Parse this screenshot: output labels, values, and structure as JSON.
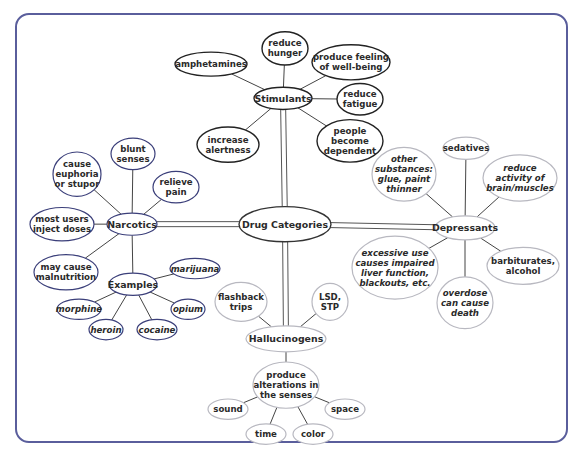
{
  "diagram": {
    "title": "Drug Categories",
    "colors": {
      "frame": "#5a5e9c",
      "stimulants": "#222222",
      "narcotics": "#3b3f7a",
      "depressants": "#b8b8c0",
      "hallucinogens": "#b8b8c0",
      "center": "#333333"
    },
    "nodes": [
      {
        "id": "center",
        "text": [
          "Drug Categories"
        ],
        "cx": 285,
        "cy": 238,
        "rx": 46,
        "ry": 19,
        "group": "center",
        "big": true
      },
      {
        "id": "stimulants",
        "text": [
          "Stimulants"
        ],
        "cx": 283,
        "cy": 102,
        "rx": 29,
        "ry": 12,
        "group": "stimulants",
        "big": true
      },
      {
        "id": "amphetamines",
        "text": [
          "amphetamines"
        ],
        "cx": 211,
        "cy": 65,
        "rx": 36,
        "ry": 13,
        "group": "stimulants"
      },
      {
        "id": "reduce-hunger",
        "text": [
          "reduce",
          "hunger"
        ],
        "cx": 285,
        "cy": 48,
        "rx": 23,
        "ry": 18,
        "group": "stimulants"
      },
      {
        "id": "well-being",
        "text": [
          "produce feeling",
          "of well-being"
        ],
        "cx": 351,
        "cy": 63,
        "rx": 39,
        "ry": 19,
        "group": "stimulants"
      },
      {
        "id": "reduce-fatigue",
        "text": [
          "reduce",
          "fatigue"
        ],
        "cx": 360,
        "cy": 103,
        "rx": 23,
        "ry": 17,
        "group": "stimulants"
      },
      {
        "id": "increase-alertness",
        "text": [
          "increase",
          "alertness"
        ],
        "cx": 228,
        "cy": 152,
        "rx": 31,
        "ry": 19,
        "group": "stimulants"
      },
      {
        "id": "dependent",
        "text": [
          "people",
          "become",
          "dependent"
        ],
        "cx": 350,
        "cy": 148,
        "rx": 33,
        "ry": 23,
        "group": "stimulants"
      },
      {
        "id": "narcotics",
        "text": [
          "Narcotics"
        ],
        "cx": 132,
        "cy": 238,
        "rx": 25,
        "ry": 12,
        "group": "narcotics",
        "big": true
      },
      {
        "id": "blunt-senses",
        "text": [
          "blunt",
          "senses"
        ],
        "cx": 133,
        "cy": 162,
        "rx": 22,
        "ry": 17,
        "group": "narcotics"
      },
      {
        "id": "euphoria",
        "text": [
          "cause",
          "euphoria",
          "or stupor"
        ],
        "cx": 77,
        "cy": 184,
        "rx": 24,
        "ry": 24,
        "group": "narcotics"
      },
      {
        "id": "relieve-pain",
        "text": [
          "relieve",
          "pain"
        ],
        "cx": 176,
        "cy": 198,
        "rx": 23,
        "ry": 17,
        "group": "narcotics"
      },
      {
        "id": "inject-doses",
        "text": [
          "most users",
          "inject doses"
        ],
        "cx": 62,
        "cy": 238,
        "rx": 32,
        "ry": 18,
        "group": "narcotics"
      },
      {
        "id": "malnutrition",
        "text": [
          "may cause",
          "malnutrition"
        ],
        "cx": 66,
        "cy": 290,
        "rx": 32,
        "ry": 19,
        "group": "narcotics"
      },
      {
        "id": "examples",
        "text": [
          "Examples"
        ],
        "cx": 133,
        "cy": 303,
        "rx": 24,
        "ry": 12,
        "group": "narcotics",
        "big": true
      },
      {
        "id": "marijuana",
        "text": [
          "marijuana"
        ],
        "cx": 195,
        "cy": 286,
        "rx": 25,
        "ry": 11,
        "group": "narcotics",
        "it": true
      },
      {
        "id": "morphine",
        "text": [
          "morphine"
        ],
        "cx": 79,
        "cy": 330,
        "rx": 22,
        "ry": 11,
        "group": "narcotics",
        "it": true
      },
      {
        "id": "opium",
        "text": [
          "opium"
        ],
        "cx": 188,
        "cy": 330,
        "rx": 17,
        "ry": 11,
        "group": "narcotics",
        "it": true
      },
      {
        "id": "heroin",
        "text": [
          "heroin"
        ],
        "cx": 106,
        "cy": 352,
        "rx": 17,
        "ry": 11,
        "group": "narcotics",
        "it": true
      },
      {
        "id": "cocaine",
        "text": [
          "cocaine"
        ],
        "cx": 157,
        "cy": 352,
        "rx": 20,
        "ry": 11,
        "group": "narcotics",
        "it": true
      },
      {
        "id": "depressants",
        "text": [
          "Depressants"
        ],
        "cx": 465,
        "cy": 242,
        "rx": 30,
        "ry": 13,
        "group": "depressants",
        "big": true
      },
      {
        "id": "sedatives",
        "text": [
          "sedatives"
        ],
        "cx": 466,
        "cy": 156,
        "rx": 23,
        "ry": 12,
        "group": "depressants"
      },
      {
        "id": "other-substances",
        "text": [
          "other",
          "substances:",
          "glue, paint",
          "thinner"
        ],
        "cx": 404,
        "cy": 184,
        "rx": 32,
        "ry": 29,
        "group": "depressants",
        "it": true
      },
      {
        "id": "reduce-activity",
        "text": [
          "reduce",
          "activity of",
          "brain/muscles"
        ],
        "cx": 520,
        "cy": 188,
        "rx": 37,
        "ry": 25,
        "group": "depressants",
        "it": true
      },
      {
        "id": "excessive-use",
        "text": [
          "excessive use",
          "causes impaired",
          "liver function,",
          "blackouts, etc."
        ],
        "cx": 395,
        "cy": 285,
        "rx": 43,
        "ry": 34,
        "group": "depressants",
        "it": true
      },
      {
        "id": "barbiturates",
        "text": [
          "barbiturates,",
          "alcohol"
        ],
        "cx": 523,
        "cy": 283,
        "rx": 36,
        "ry": 20,
        "group": "depressants"
      },
      {
        "id": "overdose",
        "text": [
          "overdose",
          "can cause",
          "death"
        ],
        "cx": 465,
        "cy": 323,
        "rx": 28,
        "ry": 28,
        "group": "depressants",
        "it": true
      },
      {
        "id": "hallucinogens",
        "text": [
          "Hallucinogens"
        ],
        "cx": 286,
        "cy": 362,
        "rx": 40,
        "ry": 14,
        "group": "hallucinogens",
        "big": true
      },
      {
        "id": "flashback",
        "text": [
          "flashback",
          "trips"
        ],
        "cx": 241,
        "cy": 322,
        "rx": 26,
        "ry": 21,
        "group": "hallucinogens"
      },
      {
        "id": "lsd",
        "text": [
          "LSD,",
          "STP"
        ],
        "cx": 330,
        "cy": 322,
        "rx": 18,
        "ry": 20,
        "group": "hallucinogens"
      },
      {
        "id": "alterations",
        "text": [
          "produce",
          "alterations in",
          "the senses"
        ],
        "cx": 286,
        "cy": 412,
        "rx": 33,
        "ry": 25,
        "group": "hallucinogens"
      },
      {
        "id": "sound",
        "text": [
          "sound"
        ],
        "cx": 228,
        "cy": 438,
        "rx": 20,
        "ry": 11,
        "group": "hallucinogens"
      },
      {
        "id": "space",
        "text": [
          "space"
        ],
        "cx": 345,
        "cy": 438,
        "rx": 20,
        "ry": 11,
        "group": "hallucinogens"
      },
      {
        "id": "time",
        "text": [
          "time"
        ],
        "cx": 266,
        "cy": 465,
        "rx": 20,
        "ry": 11,
        "group": "hallucinogens"
      },
      {
        "id": "color",
        "text": [
          "color"
        ],
        "cx": 313,
        "cy": 465,
        "rx": 20,
        "ry": 11,
        "group": "hallucinogens"
      }
    ],
    "double_links": [
      [
        "center",
        "stimulants"
      ],
      [
        "center",
        "narcotics"
      ],
      [
        "center",
        "depressants"
      ],
      [
        "center",
        "hallucinogens"
      ]
    ],
    "links": [
      [
        "stimulants",
        "amphetamines"
      ],
      [
        "stimulants",
        "reduce-hunger"
      ],
      [
        "stimulants",
        "well-being"
      ],
      [
        "stimulants",
        "reduce-fatigue"
      ],
      [
        "stimulants",
        "increase-alertness"
      ],
      [
        "stimulants",
        "dependent"
      ],
      [
        "narcotics",
        "blunt-senses"
      ],
      [
        "narcotics",
        "euphoria"
      ],
      [
        "narcotics",
        "relieve-pain"
      ],
      [
        "narcotics",
        "inject-doses"
      ],
      [
        "narcotics",
        "malnutrition"
      ],
      [
        "narcotics",
        "examples"
      ],
      [
        "examples",
        "marijuana"
      ],
      [
        "examples",
        "morphine"
      ],
      [
        "examples",
        "opium"
      ],
      [
        "examples",
        "heroin"
      ],
      [
        "examples",
        "cocaine"
      ],
      [
        "depressants",
        "sedatives"
      ],
      [
        "depressants",
        "other-substances"
      ],
      [
        "depressants",
        "reduce-activity"
      ],
      [
        "depressants",
        "excessive-use"
      ],
      [
        "depressants",
        "barbiturates"
      ],
      [
        "depressants",
        "overdose"
      ],
      [
        "hallucinogens",
        "flashback"
      ],
      [
        "hallucinogens",
        "lsd"
      ],
      [
        "hallucinogens",
        "alterations"
      ],
      [
        "alterations",
        "sound"
      ],
      [
        "alterations",
        "space"
      ],
      [
        "alterations",
        "time"
      ],
      [
        "alterations",
        "color"
      ]
    ]
  }
}
